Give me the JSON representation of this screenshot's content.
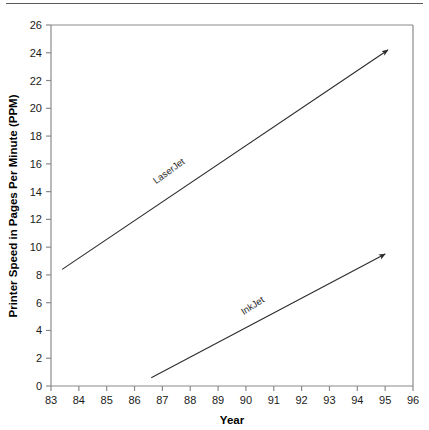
{
  "figure": {
    "background_color": "#ffffff",
    "frame_color": "#8a8a8a",
    "line_color": "#2b2b2b",
    "text_color": "#1a1a1a",
    "top_rule_color": "#5a5a5a"
  },
  "axis_titles": {
    "x": "Year",
    "y": "Printer Speed in Pages Per Minute (PPM)"
  },
  "x_ticks": [
    "83",
    "84",
    "85",
    "86",
    "87",
    "88",
    "89",
    "90",
    "91",
    "92",
    "93",
    "94",
    "95",
    "96"
  ],
  "y_ticks": [
    "0",
    "2",
    "4",
    "6",
    "8",
    "10",
    "12",
    "14",
    "16",
    "18",
    "20",
    "22",
    "24",
    "26"
  ],
  "series_labels": {
    "laserjet": "LaserJet",
    "inkjet": "InkJet"
  },
  "chart_data": {
    "type": "line",
    "title": "",
    "xlabel": "Year",
    "ylabel": "Printer Speed in Pages Per Minute (PPM)",
    "xlim": [
      83,
      96
    ],
    "ylim": [
      0,
      26
    ],
    "xticks": [
      83,
      84,
      85,
      86,
      87,
      88,
      89,
      90,
      91,
      92,
      93,
      94,
      95,
      96
    ],
    "yticks": [
      0,
      2,
      4,
      6,
      8,
      10,
      12,
      14,
      16,
      18,
      20,
      22,
      24,
      26
    ],
    "grid": false,
    "legend": "inline-annotations",
    "arrowheads": true,
    "series": [
      {
        "name": "LaserJet",
        "x": [
          83.4,
          95.1
        ],
        "values": [
          8.4,
          24.2
        ],
        "label_position": {
          "x": 87.3,
          "y": 15.3
        },
        "label_rotation_deg": -36
      },
      {
        "name": "InkJet",
        "x": [
          86.6,
          95.0
        ],
        "values": [
          0.6,
          9.5
        ],
        "label_position": {
          "x": 90.3,
          "y": 5.6
        },
        "label_rotation_deg": -33
      }
    ]
  }
}
